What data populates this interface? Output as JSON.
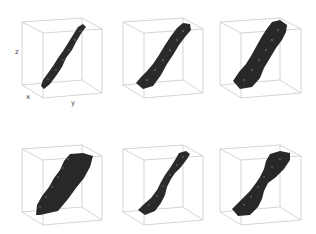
{
  "figure": {
    "axis_labels": {
      "x": "x",
      "y": "y",
      "z": "z"
    },
    "colors": {
      "background": "#ffffff",
      "cube_edge": "#b0b0b0",
      "surface": "#2a2a2a",
      "surface_highlight": "#5a5a5a"
    },
    "panels": [
      {
        "id": "top-left",
        "row": 1,
        "col": 1,
        "shape": "thin-tube",
        "show_axes": true
      },
      {
        "id": "top-middle",
        "row": 1,
        "col": 2,
        "shape": "medium-tube",
        "show_axes": false
      },
      {
        "id": "top-right",
        "row": 1,
        "col": 3,
        "shape": "thick-tube",
        "show_axes": false
      },
      {
        "id": "bottom-left",
        "row": 2,
        "col": 1,
        "shape": "wide-slab",
        "show_axes": false
      },
      {
        "id": "bottom-middle",
        "row": 2,
        "col": 2,
        "shape": "pinched-tube",
        "show_axes": false
      },
      {
        "id": "bottom-right",
        "row": 2,
        "col": 3,
        "shape": "tapered-tube",
        "show_axes": false
      }
    ]
  }
}
